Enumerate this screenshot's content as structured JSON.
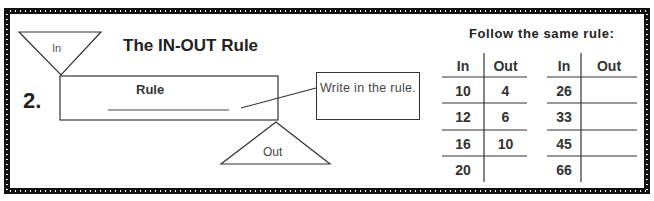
{
  "problem": {
    "number": "2.",
    "title": "The IN-OUT Rule"
  },
  "diagram": {
    "in_label": "In",
    "rule_label": "Rule",
    "rule_answer": "",
    "out_label": "Out",
    "callout_text": "Write in the rule."
  },
  "tables": {
    "heading": "Follow the same rule:",
    "left": {
      "headers": [
        "In",
        "Out"
      ],
      "rows": [
        {
          "in": "10",
          "out": "4"
        },
        {
          "in": "12",
          "out": "6"
        },
        {
          "in": "16",
          "out": "10"
        },
        {
          "in": "20",
          "out": ""
        }
      ]
    },
    "right": {
      "headers": [
        "In",
        "Out"
      ],
      "rows": [
        {
          "in": "26",
          "out": ""
        },
        {
          "in": "33",
          "out": ""
        },
        {
          "in": "45",
          "out": ""
        },
        {
          "in": "66",
          "out": ""
        }
      ]
    }
  },
  "colors": {
    "border": "#111111",
    "line": "#333333",
    "text": "#222222"
  }
}
